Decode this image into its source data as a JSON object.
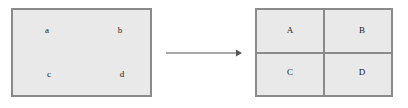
{
  "figure": {
    "type": "transformation-diagram",
    "background_color": "#ffffff"
  },
  "style": {
    "panel_fill": "#e9e9e9",
    "panel_stroke": "#8a8a8a",
    "label_color": "#1b1b1b",
    "arrow_color": "#555555"
  },
  "panels": [
    {
      "id": "before",
      "name": "undivided-rectangle",
      "labels": [
        {
          "id": "a",
          "text": "a",
          "position": "top-left"
        },
        {
          "id": "b",
          "text": "b",
          "position": "top-right"
        },
        {
          "id": "c",
          "text": "c",
          "position": "bottom-left"
        },
        {
          "id": "d",
          "text": "d",
          "position": "bottom-right"
        }
      ]
    },
    {
      "id": "after",
      "name": "quadrant-rectangle",
      "dividers": {
        "vertical": true,
        "horizontal": true
      },
      "labels": [
        {
          "id": "A",
          "text": "A",
          "position": "top-left"
        },
        {
          "id": "B",
          "text": "B",
          "position": "top-right"
        },
        {
          "id": "C",
          "text": "C",
          "position": "bottom-left"
        },
        {
          "id": "D",
          "text": "D",
          "position": "bottom-right"
        }
      ]
    }
  ],
  "arrow": {
    "direction": "right",
    "label": ""
  }
}
